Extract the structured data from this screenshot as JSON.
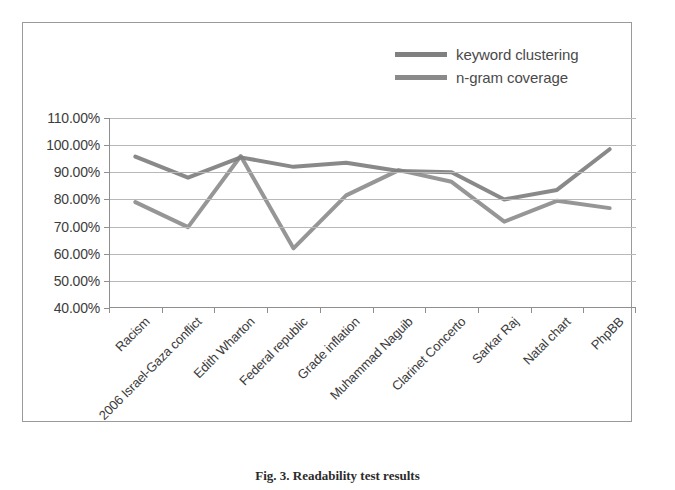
{
  "figure": {
    "caption": "Fig. 3. Readability test results"
  },
  "chart_data": {
    "type": "line",
    "title": "",
    "xlabel": "",
    "ylabel": "",
    "ylim": [
      40,
      110
    ],
    "ytick_labels": [
      "110.00%",
      "100.00%",
      "90.00%",
      "80.00%",
      "70.00%",
      "60.00%",
      "50.00%",
      "40.00%"
    ],
    "ytick_values": [
      110,
      100,
      90,
      80,
      70,
      60,
      50,
      40
    ],
    "grid": true,
    "legend_position": "top-right",
    "categories": [
      "Racism",
      "2006 Israel-Gaza conflict",
      "Edith Wharton",
      "Federal republic",
      "Grade inflation",
      "Muhammad Naguib",
      "Clarinet Concerto",
      "Sarkar Raj",
      "Natal chart",
      "PhpBB"
    ],
    "series": [
      {
        "name": "keyword clustering",
        "color": "#7f7f7f",
        "values": [
          95.8,
          88.0,
          95.5,
          92.0,
          93.5,
          90.5,
          90.0,
          80.0,
          83.5,
          98.5
        ]
      },
      {
        "name": "n-gram coverage",
        "color": "#7f7f7f",
        "values": [
          79.0,
          69.8,
          96.0,
          62.0,
          81.5,
          90.8,
          86.5,
          71.8,
          79.5,
          76.8
        ]
      }
    ]
  },
  "legend": {
    "items": [
      {
        "label": "keyword clustering",
        "swatch_color": "#808080"
      },
      {
        "label": "n-gram coverage",
        "swatch_color": "#8a8a8a"
      }
    ]
  },
  "colors": {
    "frame_border": "#9a9a9a",
    "gridline": "#b8b8b8",
    "axis": "#8f8f8f",
    "text": "#3c3c3c",
    "background": "#ffffff"
  }
}
